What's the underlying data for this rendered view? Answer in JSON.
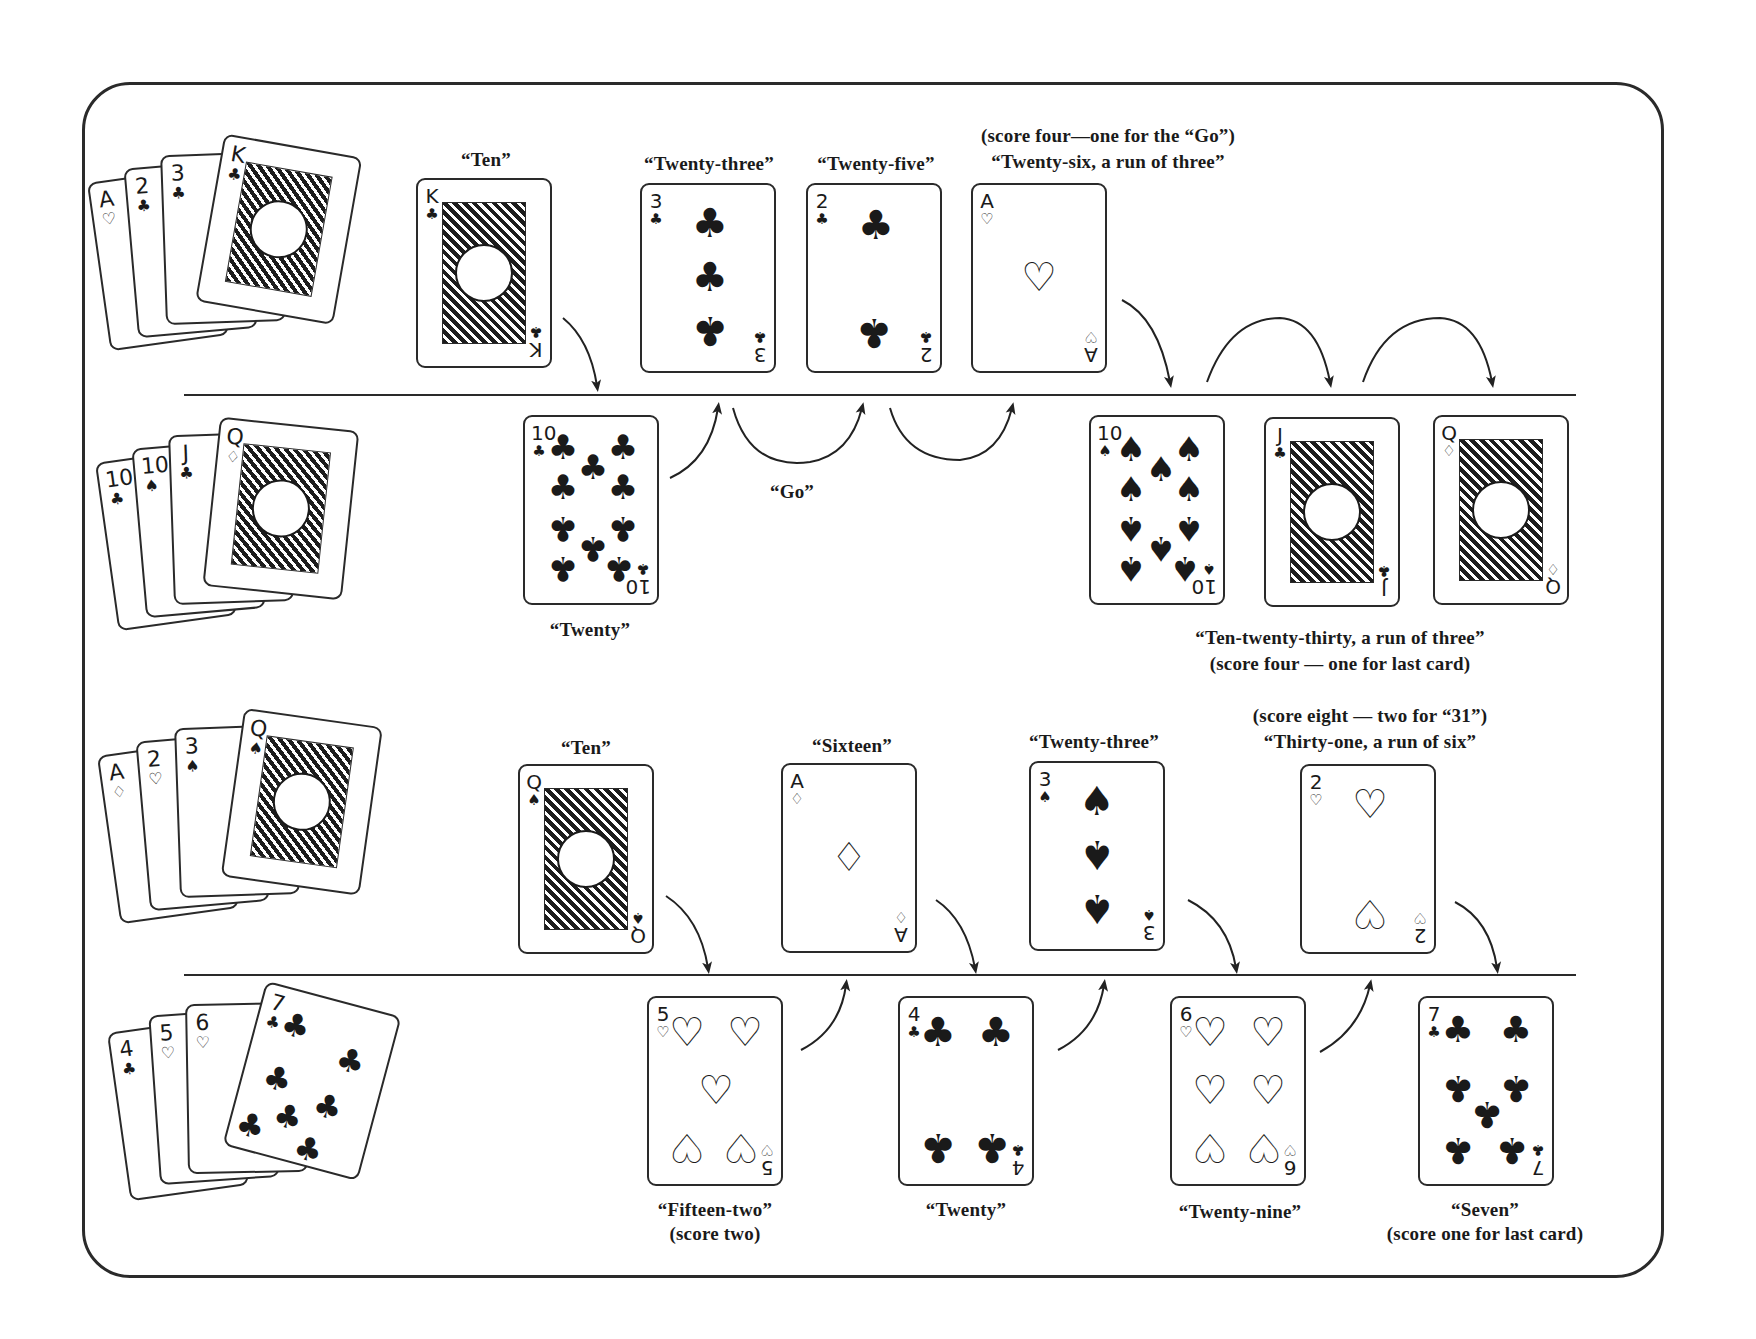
{
  "diagram": {
    "type": "cribbage-pegging-illustration",
    "rows": [
      {
        "id": "example-1-player-a",
        "hand": [
          {
            "rank": "A",
            "suit": "♡"
          },
          {
            "rank": "2",
            "suit": "♣"
          },
          {
            "rank": "3",
            "suit": "♣"
          },
          {
            "rank": "K",
            "suit": "♣"
          }
        ],
        "plays": [
          {
            "rank": "K",
            "suit": "♣",
            "caption": "“Ten”"
          },
          {
            "rank": "3",
            "suit": "♣",
            "caption": "“Twenty-three”"
          },
          {
            "rank": "2",
            "suit": "♣",
            "caption": "“Twenty-five”"
          },
          {
            "rank": "A",
            "suit": "♡",
            "caption_line1": "(score four—one for the “Go”)",
            "caption_line2": "“Twenty-six, a run of three”"
          }
        ]
      },
      {
        "id": "example-1-player-b",
        "hand": [
          {
            "rank": "10",
            "suit": "♣"
          },
          {
            "rank": "10",
            "suit": "♠"
          },
          {
            "rank": "J",
            "suit": "♣"
          },
          {
            "rank": "Q",
            "suit": "♢"
          }
        ],
        "plays": [
          {
            "rank": "10",
            "suit": "♣",
            "caption": "“Twenty”"
          },
          {
            "rank": "10",
            "suit": "♠"
          },
          {
            "rank": "J",
            "suit": "♣"
          },
          {
            "rank": "Q",
            "suit": "♢"
          }
        ],
        "go_label": "“Go”",
        "run_caption_line1": "“Ten-twenty-thirty, a run of three”",
        "run_caption_line2": "(score four — one for last card)"
      },
      {
        "id": "example-2-player-a",
        "hand": [
          {
            "rank": "A",
            "suit": "♢"
          },
          {
            "rank": "2",
            "suit": "♡"
          },
          {
            "rank": "3",
            "suit": "♠"
          },
          {
            "rank": "Q",
            "suit": "♠"
          }
        ],
        "plays": [
          {
            "rank": "Q",
            "suit": "♠",
            "caption": "“Ten”"
          },
          {
            "rank": "A",
            "suit": "♢",
            "caption": "“Sixteen”"
          },
          {
            "rank": "3",
            "suit": "♠",
            "caption": "“Twenty-three”"
          },
          {
            "rank": "2",
            "suit": "♡",
            "caption_line1": "(score eight — two for “31”)",
            "caption_line2": "“Thirty-one, a run of six”"
          }
        ]
      },
      {
        "id": "example-2-player-b",
        "hand": [
          {
            "rank": "4",
            "suit": "♣"
          },
          {
            "rank": "5",
            "suit": "♡"
          },
          {
            "rank": "6",
            "suit": "♡"
          },
          {
            "rank": "7",
            "suit": "♣"
          }
        ],
        "plays": [
          {
            "rank": "5",
            "suit": "♡",
            "caption_line1": "“Fifteen-two”",
            "caption_line2": "(score two)"
          },
          {
            "rank": "4",
            "suit": "♣",
            "caption": "“Twenty”"
          },
          {
            "rank": "6",
            "suit": "♡",
            "caption": "“Twenty-nine”"
          },
          {
            "rank": "7",
            "suit": "♣",
            "caption_line1": "“Seven”",
            "caption_line2": "(score one for last card)"
          }
        ]
      }
    ]
  }
}
